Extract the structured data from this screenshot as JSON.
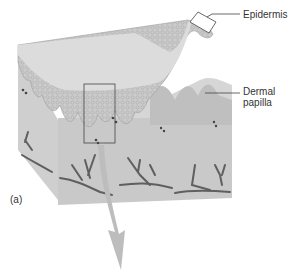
{
  "figure": {
    "panel_label": "(a)",
    "labels": {
      "epidermis": "Epidermis",
      "dermal_papilla_line1": "Dermal",
      "dermal_papilla_line2": "papilla"
    },
    "colors": {
      "surface": "#d9d9d9",
      "epidermis": "#c8c8c8",
      "dermis": "#d4d4d4",
      "block_side": "#c4c4c4",
      "vessels": "#5a5a5a",
      "arrow": "#bdbdbd",
      "leader": "#444444"
    }
  }
}
